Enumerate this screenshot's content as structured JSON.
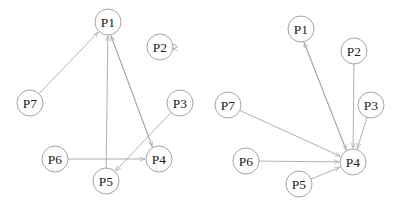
{
  "graphs": [
    {
      "name": "left-graph",
      "nodes": [
        {
          "id": "P1",
          "label": "P1",
          "x": 108,
          "y": 22
        },
        {
          "id": "P2",
          "label": "P2",
          "x": 160,
          "y": 47
        },
        {
          "id": "P3",
          "label": "P3",
          "x": 180,
          "y": 103
        },
        {
          "id": "P4",
          "label": "P4",
          "x": 159,
          "y": 159
        },
        {
          "id": "P5",
          "label": "P5",
          "x": 106,
          "y": 181
        },
        {
          "id": "P6",
          "label": "P6",
          "x": 55,
          "y": 159
        },
        {
          "id": "P7",
          "label": "P7",
          "x": 30,
          "y": 103
        }
      ],
      "edges": [
        {
          "from": "P7",
          "to": "P1"
        },
        {
          "from": "P5",
          "to": "P1"
        },
        {
          "from": "P1",
          "to": "P4",
          "offset": 2
        },
        {
          "from": "P4",
          "to": "P1",
          "offset": 2
        },
        {
          "from": "P3",
          "to": "P5"
        },
        {
          "from": "P6",
          "to": "P4"
        },
        {
          "from": "P2",
          "to": "P2",
          "self_loop": true
        }
      ]
    },
    {
      "name": "right-graph",
      "nodes": [
        {
          "id": "P1",
          "label": "P1",
          "x": 301,
          "y": 29
        },
        {
          "id": "P2",
          "label": "P2",
          "x": 354,
          "y": 51
        },
        {
          "id": "P3",
          "label": "P3",
          "x": 371,
          "y": 105
        },
        {
          "id": "P4",
          "label": "P4",
          "x": 353,
          "y": 162
        },
        {
          "id": "P5",
          "label": "P5",
          "x": 299,
          "y": 184
        },
        {
          "id": "P6",
          "label": "P6",
          "x": 246,
          "y": 161
        },
        {
          "id": "P7",
          "label": "P7",
          "x": 228,
          "y": 105
        }
      ],
      "edges": [
        {
          "from": "P1",
          "to": "P4",
          "offset": 2
        },
        {
          "from": "P4",
          "to": "P1",
          "offset": 2
        },
        {
          "from": "P2",
          "to": "P4"
        },
        {
          "from": "P3",
          "to": "P4"
        },
        {
          "from": "P7",
          "to": "P4"
        },
        {
          "from": "P6",
          "to": "P4"
        },
        {
          "from": "P5",
          "to": "P4"
        }
      ]
    }
  ],
  "style": {
    "node_radius": 13,
    "edge_color": "#a8a8a8",
    "node_stroke": "#9a9a9a",
    "label_color": "#222222"
  }
}
